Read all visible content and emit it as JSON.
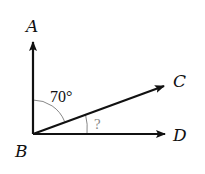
{
  "diagram": {
    "type": "angle-diagram",
    "vertex": "B",
    "points": {
      "A": {
        "label": "A",
        "direction": "up"
      },
      "B": {
        "label": "B"
      },
      "C": {
        "label": "C",
        "direction": "up-right"
      },
      "D": {
        "label": "D",
        "direction": "right"
      }
    },
    "rays": [
      {
        "from": "B",
        "to": "A",
        "label": "ray BA"
      },
      {
        "from": "B",
        "to": "C",
        "label": "ray BC"
      },
      {
        "from": "B",
        "to": "D",
        "label": "ray BD"
      }
    ],
    "angles": {
      "ABC": {
        "label": "70°",
        "between": [
          "BA",
          "BC"
        ]
      },
      "CBD": {
        "label": "?",
        "between": [
          "BC",
          "BD"
        ]
      }
    },
    "colors": {
      "line": "#111111",
      "arc": "#888888",
      "unknown_label": "#888888",
      "known_label": "#111111"
    }
  }
}
